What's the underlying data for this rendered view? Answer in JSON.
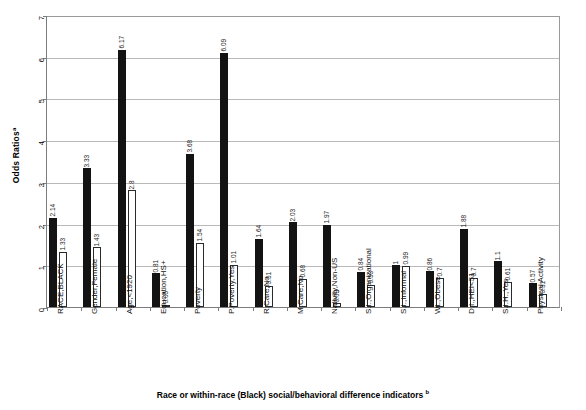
{
  "chart_data": {
    "type": "bar",
    "title": "",
    "ylabel": "Odds Ratios",
    "ylabel_superscript": "a",
    "xlabel": "Race or within-race (Black) social/behavioral difference indicators",
    "xlabel_superscript": "b",
    "ylim": [
      0,
      7
    ],
    "yticks": [
      0,
      1,
      2,
      3,
      4,
      5,
      6,
      7
    ],
    "ytick_labels": [
      "0",
      "1",
      "2",
      "3",
      "4",
      "5",
      "6",
      "7"
    ],
    "grid": true,
    "legend": "none",
    "categories": [
      "RACE,BLACK",
      "Gender,Female",
      "Age,<1920",
      "Education,HS+",
      "Poverty",
      "P.Poverty,Yes",
      "R.Care,No",
      "M.Care,No",
      "Nativity,Non-US",
      "S.I.,Organizational",
      "S.I.,Informal",
      "Wt.,Obese",
      "D.I.,HEI<51",
      "S.I.H.,Yes",
      "Physical Activity"
    ],
    "series": [
      {
        "name": "Series 1",
        "style": "dark",
        "values": [
          2.14,
          3.33,
          6.17,
          0.81,
          3.68,
          6.09,
          1.64,
          2.03,
          1.97,
          0.84,
          1,
          0.86,
          1.88,
          1.1,
          0.57
        ],
        "labels": [
          "2.14",
          "3.33",
          "6.17",
          "0.81",
          "3.68",
          "6.09",
          "1.64",
          "2.03",
          "1.97",
          "0.84",
          "1",
          "0.86",
          "1.88",
          "1.1",
          "0.57"
        ]
      },
      {
        "name": "Series 2",
        "style": "light",
        "values": [
          1.33,
          1.43,
          2.8,
          0.05,
          1.54,
          1.01,
          0.51,
          0.68,
          0.09,
          0.53,
          0.99,
          0.7,
          0.7,
          0.61,
          0.31
        ],
        "labels": [
          "1.33",
          "1.43",
          "2.8",
          "0.05",
          "1.54",
          "1.01",
          "0.51",
          "0.68",
          "0.09",
          "0.53",
          "0.99",
          "0.7",
          "0.7",
          "0.61",
          "0.31"
        ]
      }
    ]
  },
  "colors": {
    "dark_bar": "#131313",
    "light_bar": "#ffffff",
    "bar_outline": "#2a2a2a",
    "gridline": "#b9b9b9",
    "axis": "#7c7c7c",
    "background": "#ffffff",
    "text": "#111111"
  }
}
